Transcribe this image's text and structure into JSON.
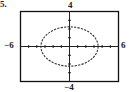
{
  "problem_number": "5.",
  "chart_data": {
    "type": "line",
    "title": "",
    "xlabel": "",
    "ylabel": "",
    "xlim": [
      -6,
      6
    ],
    "ylim": [
      -4,
      4
    ],
    "tick_labels": {
      "x_min": "−6",
      "x_max": "6",
      "y_max": "4",
      "y_min": "−4"
    },
    "tick_step": 1,
    "grid": false,
    "legend": null,
    "series": [
      {
        "name": "ellipse",
        "shape": "ellipse",
        "center": [
          0,
          0
        ],
        "semi_axis_x": 3.5,
        "semi_axis_y": 2.25,
        "style": "dotted"
      }
    ]
  }
}
